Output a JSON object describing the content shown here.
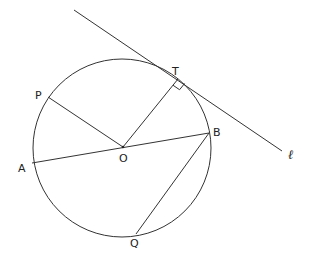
{
  "diagram": {
    "type": "circle-geometry",
    "circle": {
      "center_label": "O",
      "cx": 122,
      "cy": 148,
      "r": 89
    },
    "points": [
      {
        "id": "O",
        "label": "O",
        "x": 123,
        "y": 147,
        "lx": 119,
        "ly": 162
      },
      {
        "id": "T",
        "label": "T",
        "x": 178,
        "y": 79,
        "lx": 172,
        "ly": 75
      },
      {
        "id": "P",
        "label": "P",
        "x": 48,
        "y": 97,
        "lx": 35,
        "ly": 99
      },
      {
        "id": "A",
        "label": "A",
        "x": 32,
        "y": 163,
        "lx": 18,
        "ly": 172
      },
      {
        "id": "B",
        "label": "B",
        "x": 209,
        "y": 133,
        "lx": 213,
        "ly": 136
      },
      {
        "id": "Q",
        "label": "Q",
        "x": 136,
        "y": 234,
        "lx": 130,
        "ly": 247
      }
    ],
    "segments": [
      {
        "name": "OP",
        "from": "O",
        "to": "P"
      },
      {
        "name": "OT",
        "from": "O",
        "to": "T"
      },
      {
        "name": "AB",
        "from": "A",
        "to": "B"
      },
      {
        "name": "BQ",
        "from": "B",
        "to": "Q"
      }
    ],
    "tangent_line": {
      "label": "ℓ",
      "x1": 74,
      "y1": 10,
      "x2": 282,
      "y2": 151,
      "lx": 288,
      "ly": 159
    },
    "right_angle_marker": {
      "at": "T"
    }
  }
}
